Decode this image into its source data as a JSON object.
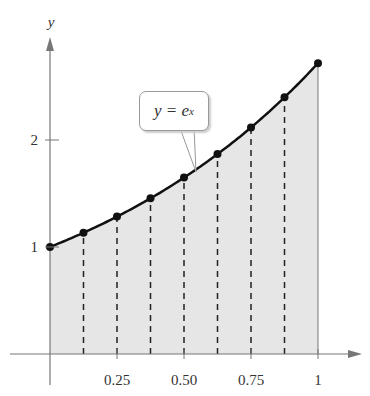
{
  "chart_data": {
    "type": "area",
    "title": "",
    "function": "y = e^x",
    "xlabel": "",
    "ylabel": "y",
    "xlim": [
      0,
      1
    ],
    "ylim": [
      0,
      3
    ],
    "x_ticks": [
      "0.25",
      "0.50",
      "0.75",
      "1"
    ],
    "y_ticks": [
      "1",
      "2"
    ],
    "x": [
      0,
      0.125,
      0.25,
      0.375,
      0.5,
      0.625,
      0.75,
      0.875,
      1
    ],
    "series": [
      {
        "name": "y = e^x",
        "values": [
          1.0,
          1.133,
          1.284,
          1.455,
          1.649,
          1.868,
          2.117,
          2.399,
          2.718
        ]
      }
    ],
    "annotations": [
      "y = e^x"
    ],
    "shaded_region": "area under curve from x=0 to x=1",
    "partition_lines": "dashed vertical lines at x = 0.125, 0.25, ..., 0.875",
    "grid": false,
    "legend": "none"
  },
  "callout": {
    "lhs": "y = e",
    "exp": "x"
  },
  "axes": {
    "y_label": "y"
  }
}
